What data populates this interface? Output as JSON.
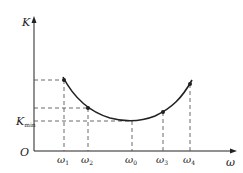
{
  "diagram": {
    "y_axis_label": "K",
    "x_axis_label": "ω",
    "origin_label": "O",
    "kmin_label": "K",
    "kmin_sub": "min",
    "points": [
      {
        "label": "ω",
        "sub": "1",
        "x": 64,
        "y": 80
      },
      {
        "label": "ω",
        "sub": "2",
        "x": 88,
        "y": 108
      },
      {
        "label": "ω",
        "sub": "0",
        "x": 132,
        "y": 121
      },
      {
        "label": "ω",
        "sub": "3",
        "x": 163,
        "y": 112
      },
      {
        "label": "ω",
        "sub": "4",
        "x": 190,
        "y": 84
      }
    ],
    "colors": {
      "line": "#222222",
      "dash": "#444444"
    }
  }
}
